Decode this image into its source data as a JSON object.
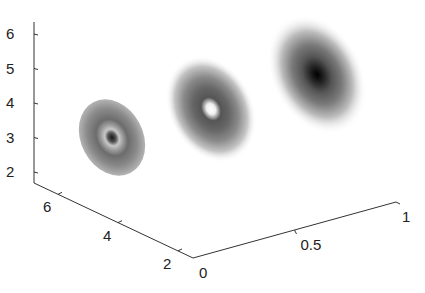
{
  "chart_data": {
    "type": "surface3d-image",
    "title": "",
    "xlabel": "",
    "ylabel": "",
    "zlabel": "",
    "axes": {
      "z": {
        "ticks": [
          2,
          3,
          4,
          5,
          6
        ],
        "tick_labels": [
          "2",
          "3",
          "4",
          "5",
          "6"
        ],
        "range": [
          1.7,
          6.4
        ]
      },
      "y": {
        "ticks": [
          2,
          4,
          6
        ],
        "tick_labels": [
          "2",
          "4",
          "6"
        ],
        "range": [
          1.5,
          6.8
        ]
      },
      "x": {
        "ticks": [
          0,
          0.5,
          1
        ],
        "tick_labels": [
          "0",
          "0.5",
          "1"
        ],
        "range": [
          0,
          1
        ]
      }
    },
    "grid": false,
    "colormap": "gray",
    "series": [
      {
        "name": "slice-1",
        "x": 0.0,
        "y": 4.5,
        "z": 3.0,
        "center": "dark",
        "ring": "light",
        "outer": "mid-gray",
        "sharp_edge": true
      },
      {
        "name": "slice-2",
        "x": 0.33,
        "y": 4.5,
        "z": 4.0,
        "center": "white",
        "ring": "dark",
        "outer": "fading",
        "sharp_edge": false
      },
      {
        "name": "slice-3",
        "x": 0.67,
        "y": 4.5,
        "z": 5.0,
        "center": "black",
        "ring": "dark",
        "outer": "fading",
        "sharp_edge": false
      }
    ]
  }
}
